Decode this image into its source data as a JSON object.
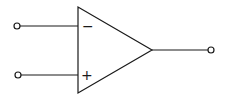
{
  "diagram": {
    "colors": {
      "stroke": "#1a1a1a",
      "background": "#ffffff"
    },
    "inputs": [
      {
        "name": "inverting-input",
        "sign": "−"
      },
      {
        "name": "non-inverting-input",
        "sign": "+"
      }
    ],
    "output": {
      "name": "output"
    }
  }
}
